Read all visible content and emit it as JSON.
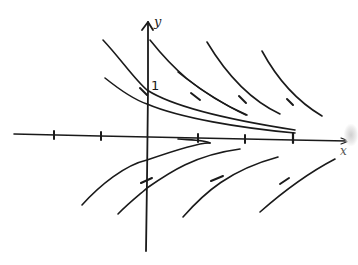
{
  "diagram": {
    "type": "slope-field-solution-curves",
    "axes": {
      "x_label": "x",
      "y_label": "y",
      "y_intercept_label": "1",
      "x_ticks_count": 5
    },
    "colors": {
      "ink": "#1a1a1a",
      "background": "#ffffff"
    },
    "solution_curves": [
      {
        "id": "upper-1",
        "region": "above-axis",
        "trend": "decreasing, approaches x-axis"
      },
      {
        "id": "upper-2",
        "region": "above-axis",
        "trend": "decreasing, approaches x-axis"
      },
      {
        "id": "upper-3",
        "region": "above-axis",
        "trend": "decreasing, approaches x-axis"
      },
      {
        "id": "upper-4",
        "region": "above-axis",
        "trend": "decreasing"
      },
      {
        "id": "upper-5",
        "region": "above-axis",
        "trend": "decreasing"
      },
      {
        "id": "upper-6",
        "region": "above-axis",
        "trend": "decreasing"
      },
      {
        "id": "lower-1",
        "region": "below-axis",
        "trend": "increasing, approaches x-axis"
      },
      {
        "id": "lower-2",
        "region": "below-axis",
        "trend": "increasing"
      },
      {
        "id": "lower-3",
        "region": "below-axis",
        "trend": "increasing"
      },
      {
        "id": "lower-4",
        "region": "below-axis",
        "trend": "increasing"
      },
      {
        "id": "lower-5",
        "region": "below-axis",
        "trend": "increasing"
      }
    ],
    "slope_marks_count": 6
  }
}
